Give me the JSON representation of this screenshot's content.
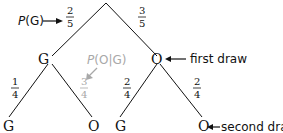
{
  "tree": {
    "level1": {
      "left_node": "G",
      "right_node": "O",
      "left_prob": {
        "num": "2",
        "den": "5"
      },
      "right_prob": {
        "num": "3",
        "den": "5"
      }
    },
    "level2": {
      "nodes": [
        "G",
        "O",
        "G",
        "O"
      ],
      "probs": [
        {
          "num": "1",
          "den": "4"
        },
        {
          "num": "3",
          "den": "4"
        },
        {
          "num": "2",
          "den": "4"
        },
        {
          "num": "2",
          "den": "4"
        }
      ]
    }
  },
  "annotations": {
    "pg_prefix": "P",
    "pg_arg": "(G)",
    "pog_prefix": "P",
    "pog_arg": "(O|G)",
    "first_draw": "first draw",
    "second_draw": "second draw"
  },
  "colors": {
    "line": "#111111",
    "highlight_gray": "#a8a8a8"
  }
}
